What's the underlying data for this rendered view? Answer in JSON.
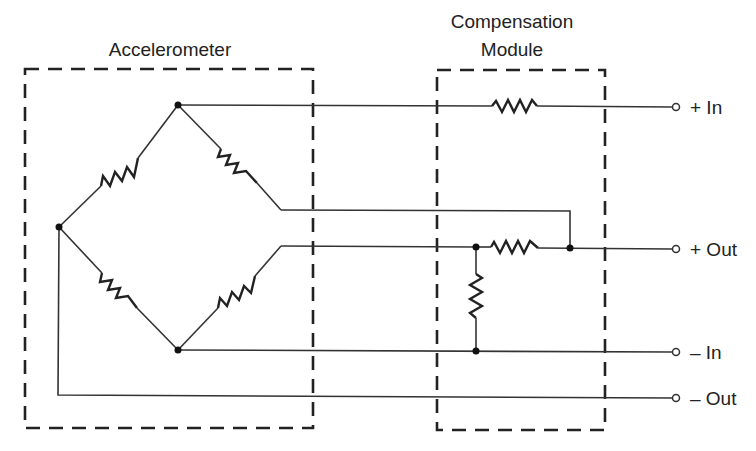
{
  "diagram": {
    "type": "circuit-schematic",
    "blocks": [
      {
        "id": "accelerometer",
        "label": "Accelerometer"
      },
      {
        "id": "compensation",
        "label_line1": "Compensation",
        "label_line2": "Module"
      }
    ],
    "terminals": [
      {
        "id": "plus-in",
        "label": "+ In"
      },
      {
        "id": "plus-out",
        "label": "+ Out"
      },
      {
        "id": "minus-in",
        "label": "– In"
      },
      {
        "id": "minus-out",
        "label": "– Out"
      }
    ],
    "components": {
      "bridge_resistors": 4,
      "compensation_resistors": 3
    },
    "colors": {
      "line": "#222222",
      "background": "#ffffff"
    }
  }
}
